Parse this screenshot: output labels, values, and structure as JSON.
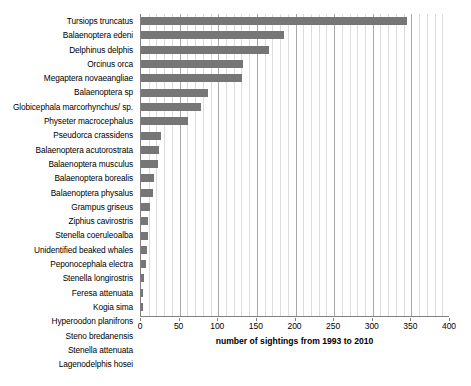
{
  "chart_data": {
    "type": "bar",
    "orientation": "horizontal",
    "title": "",
    "xlabel": "number of sightings from 1993 to 2010",
    "ylabel": "",
    "xlim": [
      0,
      400
    ],
    "xticks": [
      0,
      50,
      100,
      150,
      200,
      250,
      300,
      350,
      400
    ],
    "minor_tick_step": 10,
    "grid": "vertical",
    "legend": "none",
    "bar_color": "#767676",
    "categories": [
      "Tursiops truncatus",
      "Balaenoptera edeni",
      "Delphinus delphis",
      "Orcinus orca",
      "Megaptera novaeangliae",
      "Balaenoptera sp",
      "Globicephala marcorhynchus/ sp.",
      "Physeter macrocephalus",
      "Pseudorca crassidens",
      "Balaenoptera acutorostrata",
      "Balaenoptera musculus",
      "Balaenoptera borealis",
      "Balaenoptera physalus",
      "Grampus griseus",
      "Ziphius cavirostris",
      "Stenella coeruleoalba",
      "Unidentified beaked whales",
      "Peponocephala electra",
      "Stenella longirostris",
      "Feresa attenuata",
      "Kogia sima",
      "Hyperoodon planifrons",
      "Steno bredanensis",
      "Stenella attenuata",
      "Lagenodelphis hosei"
    ],
    "values": [
      344,
      185,
      166,
      132,
      131,
      87,
      78,
      61,
      26,
      23,
      22,
      17,
      16,
      12,
      9,
      9,
      8,
      7,
      4,
      3,
      3,
      3,
      1,
      1,
      1
    ]
  },
  "axis": {
    "tick_labels": [
      "0",
      "50",
      "100",
      "150",
      "200",
      "250",
      "300",
      "350",
      "400"
    ]
  }
}
